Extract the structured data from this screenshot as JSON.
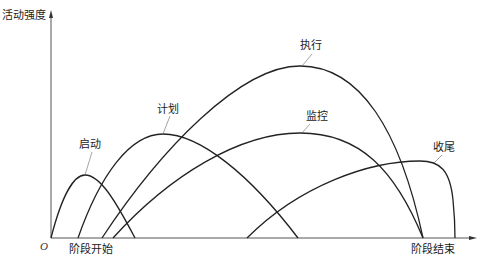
{
  "diagram": {
    "y_axis_label": "活动强度",
    "origin_label": "O",
    "x_start_label": "阶段开始",
    "x_end_label": "阶段结束",
    "curves": [
      {
        "name": "启动",
        "start_x": 51,
        "peak_x": 85,
        "peak_y": 175,
        "end_x": 135
      },
      {
        "name": "计划",
        "start_x": 78,
        "peak_x": 163,
        "peak_y": 134,
        "end_x": 298
      },
      {
        "name": "执行",
        "start_x": 102,
        "peak_x": 300,
        "peak_y": 66,
        "end_x": 423
      },
      {
        "name": "监控",
        "start_x": 113,
        "peak_x": 300,
        "peak_y": 133,
        "end_x": 423
      },
      {
        "name": "收尾",
        "start_x": 247,
        "peak_x": 425,
        "peak_y": 161,
        "end_x": 455
      }
    ],
    "line_color": "#222222",
    "axis_color": "#555555"
  }
}
